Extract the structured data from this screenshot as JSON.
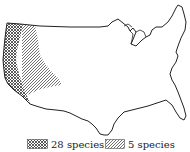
{
  "map": {
    "region": "Contiguous United States",
    "colors": {
      "outline": "#222222",
      "fill": "#ffffff",
      "hatch": "#333333"
    }
  },
  "legend": {
    "items": [
      {
        "pattern": "crosshatch",
        "label": "28 species"
      },
      {
        "pattern": "diagonal",
        "label": "5 species"
      }
    ]
  }
}
